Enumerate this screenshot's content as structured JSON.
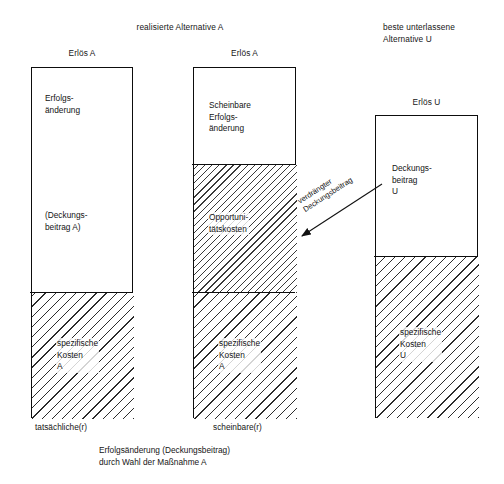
{
  "headers": {
    "group_left": "realisierte Alternative A",
    "group_right": "beste unterlassene\nAlternative U"
  },
  "columns": [
    {
      "id": "actual",
      "top_label": "Erlös A",
      "bottom_label": "tatsächliche(r)",
      "segments": [
        {
          "id": "erfolgsaenderung",
          "label": "Erfolgs-\nänderung",
          "fill": "white"
        },
        {
          "id": "deckungsbeitrag-a",
          "label": "(Deckungs-\nbeitrag A)",
          "fill": "white"
        },
        {
          "id": "spezifische-kosten-a",
          "label": "spezifische\nKosten\nA",
          "fill": "hatch-solid"
        }
      ]
    },
    {
      "id": "apparent",
      "top_label": "Erlös A",
      "bottom_label": "scheinbare(r)",
      "segments": [
        {
          "id": "scheinbare-erfolgsaenderung",
          "label": "Scheinbare\nErfolgs-\nänderung",
          "fill": "white"
        },
        {
          "id": "opportunitaetskosten",
          "label": "Opportuni-\ntätskosten",
          "fill": "hatch-dash"
        },
        {
          "id": "spezifische-kosten-a",
          "label": "spezifische\nKosten\nA",
          "fill": "hatch-solid"
        }
      ]
    },
    {
      "id": "foregone",
      "top_label": "Erlös U",
      "bottom_label": "",
      "segments": [
        {
          "id": "deckungsbeitrag-u",
          "label": "Deckungs-\nbeitrag\nU",
          "fill": "white"
        },
        {
          "id": "spezifische-kosten-u",
          "label": "spezifische\nKosten\nU",
          "fill": "hatch-solid"
        }
      ]
    }
  ],
  "annotation": {
    "arrow_label": "verdrängter\nDeckungsbeitrag"
  },
  "caption": "Erfolgsänderung (Deckungsbeitrag)\ndurch Wahl der Maßnahme A",
  "colors": {
    "stroke": "#0d0d0d",
    "text": "#161616",
    "background": "#ffffff",
    "hatch": "#2b2b2b"
  }
}
